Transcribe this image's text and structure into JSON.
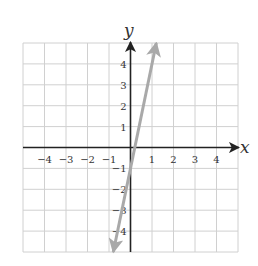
{
  "chart_data": {
    "type": "line",
    "title": "",
    "xlabel": "x",
    "ylabel": "y",
    "xlim": [
      -5,
      5
    ],
    "ylim": [
      -5,
      5
    ],
    "grid": true,
    "x_ticks": [
      -4,
      -3,
      -2,
      -1,
      1,
      2,
      3,
      4
    ],
    "y_ticks": [
      4,
      3,
      2,
      1,
      -1,
      -2,
      -3,
      -4
    ],
    "x_tick_labels": [
      "−4",
      "−3",
      "−2",
      "−1",
      "1",
      "2",
      "3",
      "4"
    ],
    "y_tick_labels": [
      "4",
      "3",
      "2",
      "1",
      "−1",
      "−2",
      "−3",
      "−4"
    ],
    "series": [
      {
        "name": "line",
        "equation": "y = 5x − 1",
        "slope": 5,
        "intercept": -1,
        "x": [
          -0.8,
          0,
          0.2,
          1.2
        ],
        "y": [
          -5,
          -1,
          0,
          5
        ],
        "arrows_both_ends": true,
        "color": "#a9a9a9"
      }
    ]
  },
  "colors": {
    "grid": "#d0d0d0",
    "axis": "#222222",
    "line": "#a9a9a9"
  }
}
